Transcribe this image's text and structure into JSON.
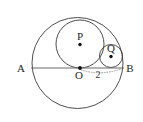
{
  "figure": {
    "canvas": {
      "width": 143,
      "height": 122,
      "background": "#ffffff"
    },
    "colors": {
      "circle_stroke": "#3a3a3a",
      "diameter_line": "#6a6a6a",
      "dotted_measure": "#9a9a9a",
      "point_dot": "#111111",
      "label_text": "#262626"
    },
    "labels": {
      "A": "A",
      "B": "B",
      "O": "O",
      "P": "P",
      "Q": "Q",
      "measure": "2"
    },
    "shapes": {
      "large_circle": {
        "cx": 77.5,
        "cy": 63.0,
        "r": 45.5,
        "name": "large-circle-AB"
      },
      "medium_circle": {
        "cx": 80.0,
        "cy": 44.0,
        "r": 24.0,
        "name": "medium-circle-P"
      },
      "small_circle": {
        "cx": 111.0,
        "cy": 56.0,
        "r": 11.5,
        "name": "small-circle-Q"
      },
      "diameter": {
        "x1": 32.0,
        "y1": 68.0,
        "x2": 123.0,
        "y2": 68.0,
        "name": "diameter-AB"
      },
      "dotted_arc": {
        "from_x": 80.0,
        "from_y": 68.5,
        "to_x": 122.0,
        "to_y": 68.5,
        "name": "dotted-measure-arc"
      }
    },
    "points": [
      {
        "id": "O",
        "x": 80.0,
        "y": 68.0,
        "label_dx": -3.5,
        "label_dy": 11.0
      },
      {
        "id": "P",
        "x": 80.0,
        "y": 44.5,
        "label_dx": -3.5,
        "label_dy": -4.5
      },
      {
        "id": "Q",
        "x": 111.0,
        "y": 56.5,
        "label_dx": -3.5,
        "label_dy": -4.5
      }
    ],
    "endpoint_labels": [
      {
        "id": "A",
        "x": 22.0,
        "y": 71.5
      },
      {
        "id": "B",
        "x": 126.5,
        "y": 71.5
      }
    ],
    "measure_label": {
      "id": "measure",
      "x": 97.0,
      "y": 76.0
    }
  }
}
